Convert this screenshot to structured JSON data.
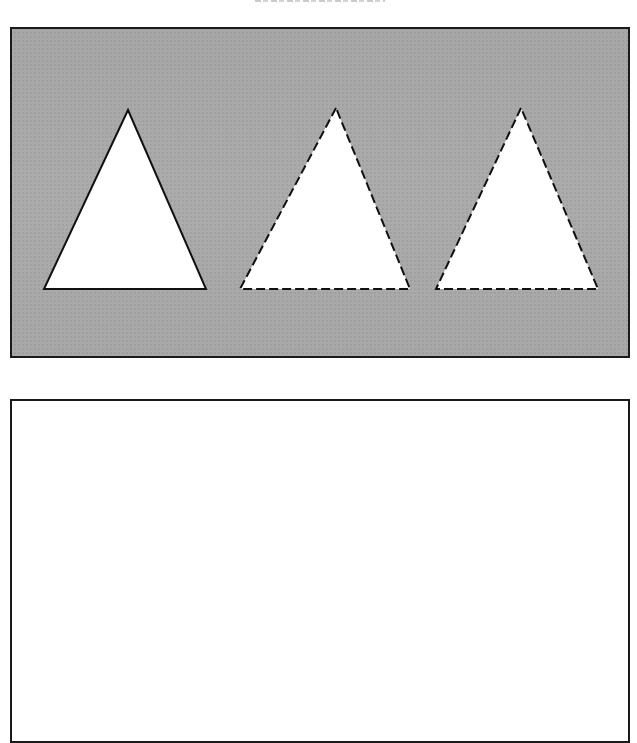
{
  "figure": {
    "caption_clipped": true,
    "top_panel": {
      "background_color": "#a9a9a9",
      "border_color": "#1a1a1a",
      "shapes": [
        {
          "name": "triangle-solid",
          "outline": "solid",
          "fill": "#ffffff",
          "stroke": "#111111",
          "points": [
            [
              116,
              81
            ],
            [
              32,
              260
            ],
            [
              194,
              260
            ]
          ]
        },
        {
          "name": "triangle-dashed-1",
          "outline": "dashed",
          "fill": "#ffffff",
          "stroke": "#111111",
          "points": [
            [
              324,
              79
            ],
            [
              228,
              260
            ],
            [
              398,
              260
            ]
          ]
        },
        {
          "name": "triangle-dashed-2",
          "outline": "dashed",
          "fill": "#ffffff",
          "stroke": "#111111",
          "points": [
            [
              509,
              79
            ],
            [
              424,
              260
            ],
            [
              586,
              260
            ]
          ]
        }
      ]
    },
    "bottom_panel": {
      "background_color": "#ffffff",
      "border_color": "#1a1a1a",
      "content": ""
    }
  }
}
